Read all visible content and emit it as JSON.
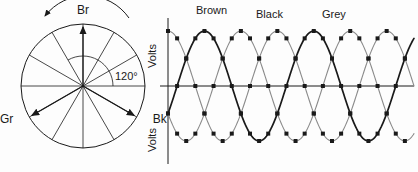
{
  "figure": {
    "title_visible": false,
    "background": "#fdfdfd",
    "ink": "#1a1a1a",
    "grey": "#8a8a8a"
  },
  "phasor": {
    "name": "three-phase-phasor-star",
    "center": {
      "x": 83,
      "y": 86
    },
    "radius": 62,
    "hub_size": 6,
    "spoke_count": 12,
    "spoke_step_deg": 30,
    "rotation": {
      "label": "Br",
      "direction": "counterclockwise",
      "arrow_name": "rotation-arrow"
    },
    "angle_arc": {
      "label": "120°",
      "from_deg": 0,
      "to_deg": 120,
      "radius": 30
    },
    "phasors": [
      {
        "label": "Br",
        "angle_deg": 90,
        "label_dx": 0,
        "label_dy": -10
      },
      {
        "label": "Gr",
        "angle_deg": 210,
        "label_dx": -16,
        "label_dy": 6
      },
      {
        "label": "Bk",
        "angle_deg": 330,
        "label_dx": 16,
        "label_dy": 6
      }
    ]
  },
  "chart_data": {
    "type": "line",
    "title": "",
    "xlabel": "",
    "ylabel": "Volts",
    "axis_labels": {
      "upper": "Volts",
      "lower": "Volts"
    },
    "x_start_deg": 0,
    "x_end_deg": 810,
    "marker_step_deg": 30,
    "amplitude": 55,
    "ylim": [
      -55,
      55
    ],
    "grid": false,
    "legend_position": "top",
    "series": [
      {
        "name": "Brown",
        "color": "#8a8a8a",
        "phase_deg": 90,
        "weight": 1.1,
        "label_x": 196,
        "label_y": 14
      },
      {
        "name": "Black",
        "color": "#1a1a1a",
        "phase_deg": -30,
        "weight": 1.7,
        "label_x": 256,
        "label_y": 18
      },
      {
        "name": "Grey",
        "color": "#8a8a8a",
        "phase_deg": -150,
        "weight": 1.1,
        "label_x": 322,
        "label_y": 18
      }
    ]
  }
}
